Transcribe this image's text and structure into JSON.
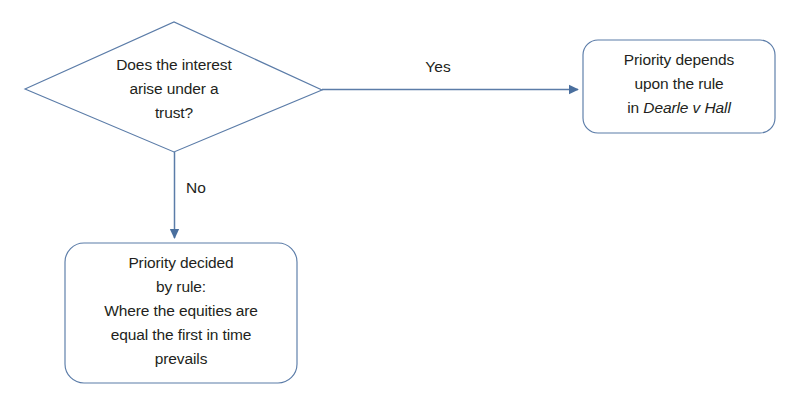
{
  "diagram": {
    "type": "flowchart",
    "colors": {
      "line": "#5b7ca8",
      "text": "#231f20",
      "background": "#ffffff"
    },
    "decision": {
      "shape": "diamond",
      "text": "Does the interest\narise under a\ntrust?"
    },
    "edges": [
      {
        "label": "Yes",
        "from": "decision",
        "to": "outcome-trust",
        "direction": "right"
      },
      {
        "label": "No",
        "from": "decision",
        "to": "outcome-general",
        "direction": "down"
      }
    ],
    "outcome_trust": {
      "shape": "rounded-rectangle",
      "line1": "Priority depends",
      "line2": "upon the rule",
      "line3_prefix": "in ",
      "line3_case": "Dearle v Hall"
    },
    "outcome_general": {
      "shape": "rounded-rectangle",
      "text": "Priority decided\nby rule:\nWhere the equities are\nequal the first in time\nprevails"
    }
  }
}
